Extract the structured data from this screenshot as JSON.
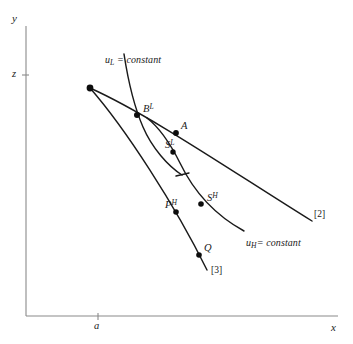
{
  "figure": {
    "kind": "economic-indifference-curve-diagram",
    "background_color": "#ffffff",
    "ink_color": "#1a1a1a",
    "axis_color": "#8a8a8a"
  },
  "axes": {
    "y_label": "y",
    "x_label": "x",
    "y_tick_label": "z",
    "x_tick_label": "a",
    "y_axis_x_px": 26,
    "y_axis_top_px": 26,
    "x_axis_y_px": 316,
    "x_axis_right_px": 338,
    "y_tick_y_px": 75,
    "x_tick_x_px": 98
  },
  "curve_labels": {
    "u_low": {
      "base": "u",
      "sub": "L",
      "rest": " = constant"
    },
    "u_high": {
      "base": "u",
      "sub": "H",
      "rest": "= constant"
    }
  },
  "line_labels": {
    "line2": "[2]",
    "line3": "[3]"
  },
  "points": [
    {
      "id": "endowment",
      "label": "",
      "x": 90,
      "y": 88,
      "r": 3.4
    },
    {
      "id": "B-low",
      "label_base": "B",
      "label_sup": "L",
      "x": 137,
      "y": 115,
      "r": 3.0,
      "lx": 143,
      "ly": 103
    },
    {
      "id": "A",
      "label_base": "A",
      "label_sup": "",
      "x": 176,
      "y": 133,
      "r": 2.9,
      "lx": 181,
      "ly": 121
    },
    {
      "id": "S-low",
      "label_base": "S",
      "label_sup": "L",
      "x": 173,
      "y": 152,
      "r": 2.7,
      "lx": 165,
      "ly": 139
    },
    {
      "id": "P-high",
      "label_base": "P",
      "label_sup": "H",
      "x": 176,
      "y": 212,
      "r": 2.8,
      "lx": 165,
      "ly": 199
    },
    {
      "id": "S-high",
      "label_base": "S",
      "label_sup": "H",
      "x": 201,
      "y": 204,
      "r": 2.8,
      "lx": 207,
      "ly": 192
    },
    {
      "id": "Q",
      "label_base": "Q",
      "label_sup": "",
      "x": 199,
      "y": 255,
      "r": 2.8,
      "lx": 204,
      "ly": 243
    }
  ],
  "paths": {
    "line2": "M 90 88 C 150 115, 230 170, 312 221",
    "line3": "M 90 88 C 125 128, 175 205, 207 270",
    "u_low_curve": "M 124 54 C 128 80, 133 104, 143 127 C 152 148, 168 166, 182 175",
    "u_high_curve": "M 147 118 C 160 128, 170 143, 180 163 C 193 190, 213 214, 244 231",
    "u_low_hook": "M 176 176 L 189 173"
  },
  "text_positions": {
    "y_axis_label": {
      "x": 12,
      "y": 13
    },
    "x_axis_label": {
      "x": 331,
      "y": 322
    },
    "z_tick_label": {
      "x": 12,
      "y": 69
    },
    "a_tick_label": {
      "x": 94,
      "y": 321
    },
    "u_low_label": {
      "x": 105,
      "y": 55
    },
    "u_high_label": {
      "x": 246,
      "y": 238
    },
    "line2_label": {
      "x": 314,
      "y": 210
    },
    "line3_label": {
      "x": 211,
      "y": 266
    }
  }
}
